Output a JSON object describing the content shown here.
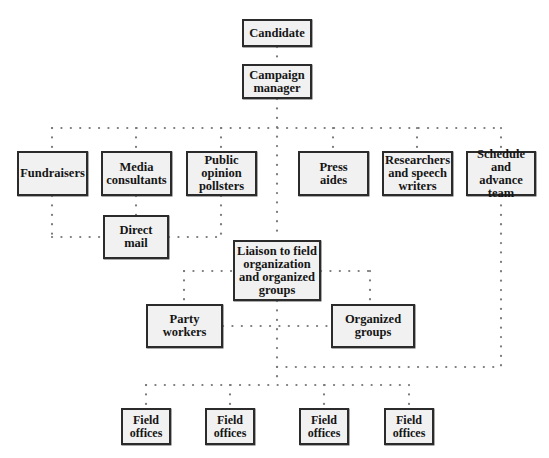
{
  "diagram": {
    "type": "org-chart",
    "line_style": "dotted",
    "colors": {
      "box_fill": "#f1f1f1",
      "box_border": "#2b2b2b",
      "text": "#151515",
      "connector": "#7a7a7a",
      "background": "#ffffff"
    },
    "nodes": {
      "candidate": "Candidate",
      "campaign_manager": "Campaign\nmanager",
      "fundraisers": "Fundraisers",
      "media_consultants": "Media\nconsultants",
      "public_opinion_pollsters": "Public\nopinion\npollsters",
      "press_aides": "Press\naides",
      "researchers": "Researchers\nand speech\nwriters",
      "schedule_team": "Schedule\nand advance\nteam",
      "direct_mail": "Direct mail",
      "liaison": "Liaison to field\norganization\nand organized\ngroups",
      "party_workers": "Party\nworkers",
      "organized_groups": "Organized\ngroups",
      "field_offices": [
        "Field\noffices",
        "Field\noffices",
        "Field\noffices",
        "Field\noffices"
      ]
    },
    "edges": [
      [
        "Candidate",
        "Campaign manager"
      ],
      [
        "Campaign manager",
        "Fundraisers"
      ],
      [
        "Campaign manager",
        "Media consultants"
      ],
      [
        "Campaign manager",
        "Public opinion pollsters"
      ],
      [
        "Campaign manager",
        "Press aides"
      ],
      [
        "Campaign manager",
        "Researchers and speech writers"
      ],
      [
        "Campaign manager",
        "Schedule and advance team"
      ],
      [
        "Campaign manager",
        "Liaison to field organization and organized groups"
      ],
      [
        "Fundraisers",
        "Direct mail"
      ],
      [
        "Media consultants",
        "Direct mail"
      ],
      [
        "Public opinion pollsters",
        "Direct mail"
      ],
      [
        "Liaison to field organization and organized groups",
        "Party workers"
      ],
      [
        "Liaison to field organization and organized groups",
        "Organized groups"
      ],
      [
        "Party workers",
        "Organized groups"
      ],
      [
        "Schedule and advance team",
        "Field offices"
      ],
      [
        "Liaison to field organization and organized groups",
        "Field offices"
      ]
    ]
  }
}
